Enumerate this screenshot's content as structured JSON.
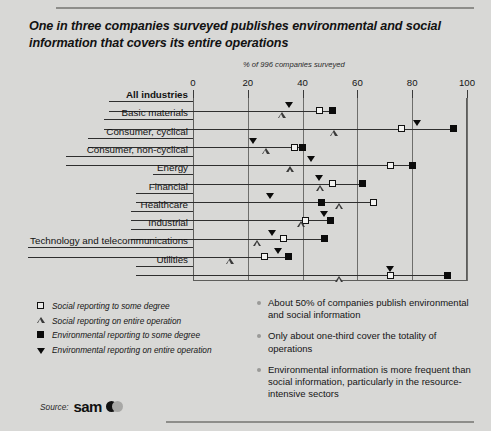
{
  "headline": "One in three companies surveyed publishes environmental and social information that covers its entire operations",
  "source": {
    "label": "Source:",
    "logo_text": "sam",
    "logo_mark": "sam-circles-logo"
  },
  "chart_data": {
    "type": "scatter",
    "title": "One in three companies surveyed publishes environmental and social information that covers its entire operations",
    "subtitle": "% of 996 companies surveyed",
    "xlabel": "% of 996 companies surveyed",
    "ylabel": "",
    "xlim": [
      0,
      100
    ],
    "ticks": [
      0,
      20,
      40,
      60,
      80,
      100
    ],
    "grid": true,
    "legend_position": "below-left",
    "categories": [
      "All industries",
      "Basic materials",
      "Consumer, cyclical",
      "Consumer, non-cyclical",
      "Energy",
      "Financial",
      "Healthcare",
      "Industrial",
      "Technology and telecommunications",
      "Utilities"
    ],
    "series": [
      {
        "name": "Social reporting to some degree",
        "marker": "square-open",
        "values": [
          46,
          76,
          37,
          72,
          51,
          66,
          41,
          33,
          26,
          72
        ]
      },
      {
        "name": "Social reporting on entire operation",
        "marker": "triangle-open",
        "values": [
          31,
          50,
          25,
          34,
          45,
          52,
          38,
          22,
          12,
          52
        ]
      },
      {
        "name": "Environmental reporting to some degree",
        "marker": "square-filled",
        "values": [
          51,
          95,
          40,
          80,
          62,
          47,
          50,
          48,
          35,
          93
        ]
      },
      {
        "name": "Environmental reporting on entire operation",
        "marker": "triangle-filled",
        "values": [
          35,
          82,
          22,
          43,
          46,
          28,
          48,
          29,
          31,
          72
        ]
      }
    ]
  },
  "legend": [
    {
      "marker": "square-open",
      "label": "Social reporting to some degree"
    },
    {
      "marker": "triangle-open",
      "label": "Social reporting on entire operation"
    },
    {
      "marker": "square-filled",
      "label": "Environmental reporting to some degree"
    },
    {
      "marker": "triangle-filled",
      "label": "Environmental reporting on entire operation"
    }
  ],
  "bullets": [
    "About 50% of companies publish environmental and social information",
    "Only about one-third cover the totality of operations",
    "Environmental information is more frequent than social information, particularly in the resource-intensive sectors"
  ]
}
